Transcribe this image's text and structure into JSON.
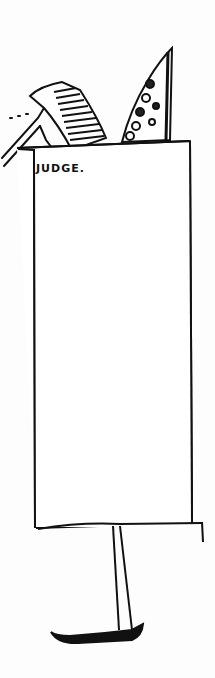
{
  "drawing": {
    "description": "Hand-drawn sketch of a tall rectangular sign board on a single post",
    "sign_label": "JUDGE.",
    "ink_color": "#111111",
    "paper_color": "#fdfdfd"
  }
}
